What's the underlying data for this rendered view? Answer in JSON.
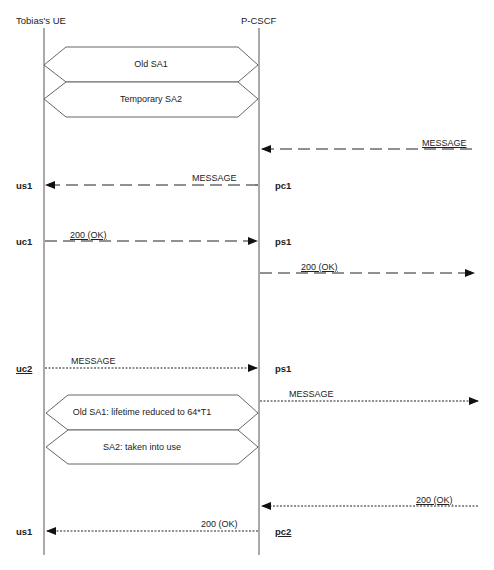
{
  "participants": [
    {
      "name": "Tobias's UE"
    },
    {
      "name": "P-CSCF"
    }
  ],
  "security_associations": [
    {
      "label": "Old SA1"
    },
    {
      "label": "Temporary SA2"
    },
    {
      "label": "Old SA1: lifetime reduced to 64*T1"
    },
    {
      "label": "SA2: taken into use"
    }
  ],
  "messages": [
    {
      "label": "MESSAGE",
      "from": "network",
      "to": "P-CSCF",
      "style": "dashed"
    },
    {
      "label": "MESSAGE",
      "from": "P-CSCF",
      "to": "Tobias's UE",
      "style": "dashed"
    },
    {
      "label": "200 (OK)",
      "from": "Tobias's UE",
      "to": "P-CSCF",
      "style": "dashed"
    },
    {
      "label": "200 (OK)",
      "from": "P-CSCF",
      "to": "network",
      "style": "dashed"
    },
    {
      "label": "MESSAGE",
      "from": "Tobias's UE",
      "to": "P-CSCF",
      "style": "dotted"
    },
    {
      "label": "MESSAGE",
      "from": "P-CSCF",
      "to": "network",
      "style": "dotted"
    },
    {
      "label": "200 (OK)",
      "from": "network",
      "to": "P-CSCF",
      "style": "dotted"
    },
    {
      "label": "200 (OK)",
      "from": "P-CSCF",
      "to": "Tobias's UE",
      "style": "dotted"
    }
  ],
  "port_labels": {
    "ue": [
      "us1",
      "uc1",
      "uc2",
      "us1"
    ],
    "pcscf": [
      "pc1",
      "ps1",
      "ps1",
      "pc2"
    ]
  }
}
